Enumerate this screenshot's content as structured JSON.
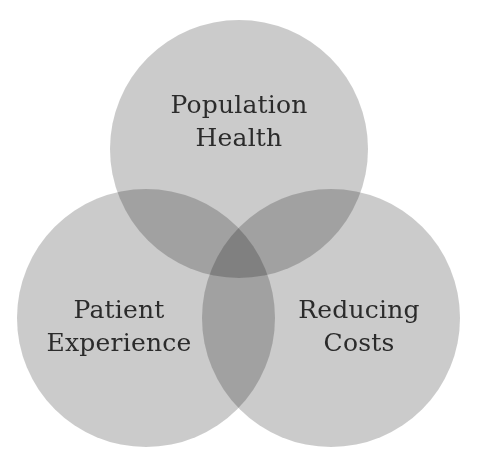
{
  "diagram": {
    "type": "venn",
    "circle_color": "#c8c8c8",
    "overlap_color": "#b0b0b0",
    "text_color": "#2b2b2b",
    "sets": [
      {
        "id": "population-health",
        "line1": "Population",
        "line2": "Health"
      },
      {
        "id": "patient-experience",
        "line1": "Patient",
        "line2": "Experience"
      },
      {
        "id": "reducing-costs",
        "line1": "Reducing",
        "line2": "Costs"
      }
    ]
  }
}
